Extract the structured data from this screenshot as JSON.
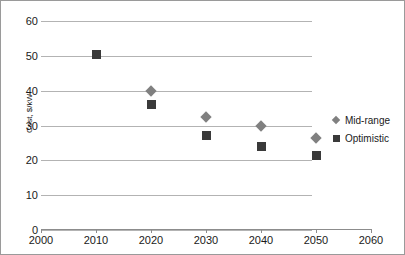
{
  "chart_data": {
    "type": "scatter",
    "title": "",
    "xlabel": "",
    "ylabel": "Cost, $/kW",
    "xlim": [
      2000,
      2060
    ],
    "ylim": [
      0,
      60
    ],
    "xticks": [
      2000,
      2010,
      2020,
      2030,
      2040,
      2050,
      2060
    ],
    "yticks": [
      0,
      10,
      20,
      30,
      40,
      50,
      60
    ],
    "grid": "horizontal",
    "legend_position": "right",
    "series": [
      {
        "name": "Mid-range",
        "marker": "diamond",
        "color": "#808080",
        "points": [
          {
            "x": 2020,
            "y": 40
          },
          {
            "x": 2030,
            "y": 32.5
          },
          {
            "x": 2040,
            "y": 30
          },
          {
            "x": 2050,
            "y": 26.5
          }
        ]
      },
      {
        "name": "Optimistic",
        "marker": "square",
        "color": "#3a3a3a",
        "points": [
          {
            "x": 2010,
            "y": 50.5
          },
          {
            "x": 2020,
            "y": 36
          },
          {
            "x": 2030,
            "y": 27
          },
          {
            "x": 2040,
            "y": 24
          },
          {
            "x": 2050,
            "y": 21.5
          }
        ]
      }
    ]
  },
  "axis": {
    "y_title": "Cost, $/kW",
    "y_tick_labels": [
      "60",
      "50",
      "40",
      "30",
      "20",
      "10",
      "0"
    ],
    "x_tick_labels": [
      "2000",
      "2010",
      "2020",
      "2030",
      "2040",
      "2050",
      "2060"
    ]
  },
  "legend": {
    "entries": [
      {
        "label": "Mid-range",
        "marker": "diamond-marker-icon"
      },
      {
        "label": "Optimistic",
        "marker": "square-marker-icon"
      }
    ]
  }
}
